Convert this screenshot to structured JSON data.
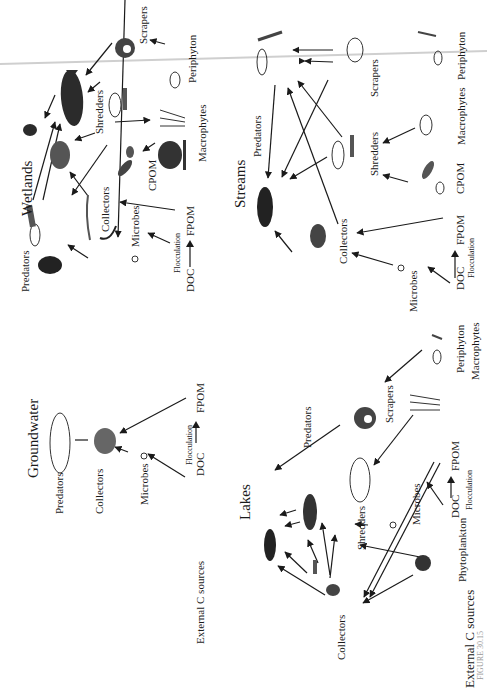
{
  "figure": {
    "caption_fragment": "FIGURE 30.15"
  },
  "panels": {
    "wetlands": {
      "title": "Wetlands",
      "labels": {
        "predators": "Predators",
        "collectors": "Collectors",
        "microbes": "Microbes",
        "shredders": "Shredders",
        "scrapers": "Scrapers",
        "periphyton": "Periphyton",
        "macrophytes": "Macrophytes",
        "cpom": "CPOM",
        "fpom": "FPOM",
        "doc": "DOC",
        "flocculation": "Flocculation"
      }
    },
    "streams": {
      "title": "Streams",
      "labels": {
        "predators": "Predators",
        "collectors": "Collectors",
        "microbes": "Microbes",
        "shredders": "Shredders",
        "scrapers": "Scrapers",
        "periphyton": "Periphyton",
        "macrophytes": "Macrophytes",
        "cpom": "CPOM",
        "fpom": "FPOM",
        "doc": "DOC",
        "flocculation": "Flocculation"
      }
    },
    "groundwater": {
      "title": "Groundwater",
      "labels": {
        "predators": "Predators",
        "collectors": "Collectors",
        "microbes": "Microbes",
        "fpom": "FPOM",
        "doc": "DOC",
        "flocculation": "Flocculation",
        "external": "External C sources"
      }
    },
    "lakes": {
      "title": "Lakes",
      "labels": {
        "predators": "Predators",
        "collectors": "Collectors",
        "microbes": "Microbes",
        "shredders": "Shredders",
        "scrapers": "Scrapers",
        "periphyton": "Periphyton",
        "macrophytes": "Macrophytes",
        "phytoplankton": "Phytoplankton",
        "fpom": "FPOM",
        "doc": "DOC",
        "flocculation": "Flocculation",
        "external": "External C sources"
      }
    }
  },
  "colors": {
    "ink": "#1a1a1a",
    "scan_line": "#c8c8c8",
    "background": "#ffffff"
  }
}
